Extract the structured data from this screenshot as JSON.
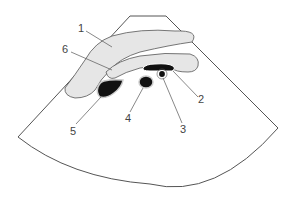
{
  "diagram": {
    "type": "ultrasound-sector-schematic",
    "colors": {
      "outline": "#555555",
      "tissue_fill": "#e6e6e6",
      "vessel_fill": "#111111",
      "background": "#ffffff",
      "label": "#444444"
    },
    "labels": [
      {
        "id": "1",
        "text": "1"
      },
      {
        "id": "2",
        "text": "2"
      },
      {
        "id": "3",
        "text": "3"
      },
      {
        "id": "4",
        "text": "4"
      },
      {
        "id": "5",
        "text": "5"
      },
      {
        "id": "6",
        "text": "6"
      }
    ]
  }
}
